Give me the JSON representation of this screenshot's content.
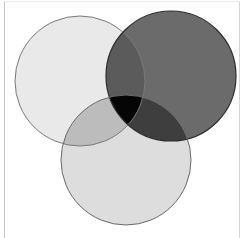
{
  "diagram": {
    "type": "venn",
    "sets": 3,
    "circles": [
      {
        "id": "top-left",
        "cx": 80,
        "cy": 81,
        "r": 65,
        "fill": "#e9e9e9"
      },
      {
        "id": "top-right",
        "cx": 171,
        "cy": 76,
        "r": 65,
        "fill": "#6b6b6b"
      },
      {
        "id": "bottom",
        "cx": 126,
        "cy": 160,
        "r": 65,
        "fill": "#dddddd"
      }
    ],
    "overlaps": {
      "top-left_top-right": "#5b5b5b",
      "top-left_bottom": "#bcbcbc",
      "top-right_bottom": "#3e3e3e",
      "all": "#050505"
    },
    "stroke": "#5a5a5a"
  }
}
